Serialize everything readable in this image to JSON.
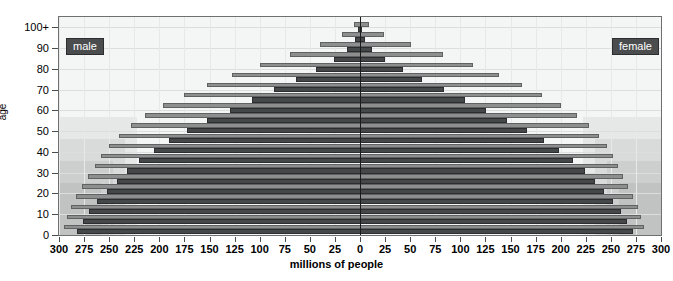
{
  "chart_data": {
    "type": "bar",
    "subtype": "population-pyramid",
    "title": "",
    "xlabel": "millions of people",
    "ylabel": "age",
    "xlim": [
      -300,
      300
    ],
    "ylim": [
      0,
      105
    ],
    "grid": true,
    "legend_position": "inside-top-left and inside-top-right",
    "x_ticks": [
      300,
      275,
      250,
      225,
      200,
      175,
      150,
      125,
      100,
      75,
      50,
      25,
      0,
      25,
      50,
      75,
      100,
      125,
      150,
      175,
      200,
      225,
      250,
      275,
      300
    ],
    "y_ticks": [
      "0",
      "10",
      "20",
      "30",
      "40",
      "50",
      "60",
      "70",
      "80",
      "90",
      "100+"
    ],
    "legend": [
      {
        "name": "male",
        "side": "left",
        "color": "#454849"
      },
      {
        "name": "female",
        "side": "right",
        "color": "#454849"
      }
    ],
    "series_note": "Each age band shows a lighter upper bar (total) and a darker lower bar (subgroup).",
    "categories": [
      "0-4",
      "5-9",
      "10-14",
      "15-19",
      "20-24",
      "25-29",
      "30-34",
      "35-39",
      "40-44",
      "45-49",
      "50-54",
      "55-59",
      "60-64",
      "65-69",
      "70-74",
      "75-79",
      "80-84",
      "85-89",
      "90-94",
      "95-99",
      "100+"
    ],
    "series": [
      {
        "name": "male-light",
        "side": "left",
        "values": [
          295,
          292,
          288,
          283,
          277,
          271,
          264,
          258,
          250,
          240,
          228,
          214,
          196,
          175,
          152,
          128,
          100,
          70,
          40,
          18,
          6
        ]
      },
      {
        "name": "male-dark",
        "side": "left",
        "values": [
          282,
          276,
          270,
          262,
          252,
          242,
          232,
          220,
          205,
          190,
          172,
          152,
          130,
          108,
          86,
          64,
          44,
          26,
          13,
          5,
          2
        ]
      },
      {
        "name": "female-light",
        "side": "right",
        "values": [
          283,
          280,
          277,
          272,
          267,
          262,
          257,
          252,
          246,
          238,
          228,
          216,
          200,
          181,
          161,
          139,
          113,
          83,
          51,
          24,
          9
        ]
      },
      {
        "name": "female-dark",
        "side": "right",
        "values": [
          272,
          266,
          260,
          252,
          243,
          234,
          224,
          212,
          198,
          183,
          166,
          147,
          126,
          105,
          84,
          62,
          43,
          25,
          12,
          5,
          2
        ]
      }
    ]
  },
  "axes": {
    "x_title": "millions of people",
    "y_title": "age"
  },
  "legend": {
    "male": "male",
    "female": "female"
  }
}
